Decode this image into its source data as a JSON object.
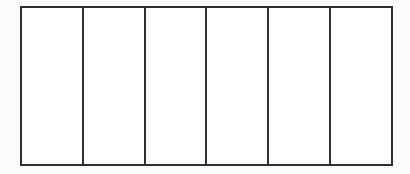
{
  "figure": {
    "type": "empty-cell-strip",
    "cell_count": 6,
    "cells": [
      {
        "label": ""
      },
      {
        "label": ""
      },
      {
        "label": ""
      },
      {
        "label": ""
      },
      {
        "label": ""
      },
      {
        "label": ""
      }
    ],
    "colors": {
      "border": "#2e2e2e",
      "fill": "#ffffff",
      "background": "#fbfbfa"
    }
  }
}
